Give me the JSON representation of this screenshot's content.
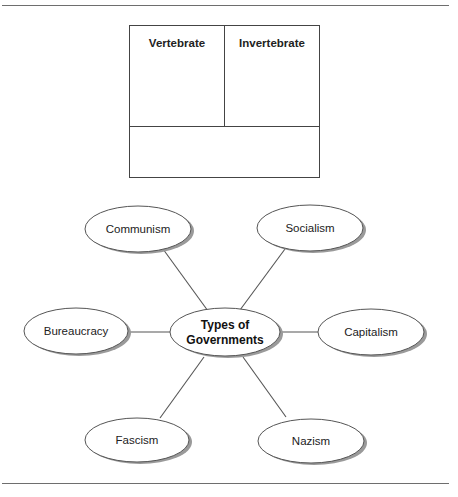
{
  "figure": {
    "caption_fragment": "",
    "top_rule": true,
    "bottom_rule": true
  },
  "chart_box": {
    "columns": [
      {
        "label": "Vertebrate"
      },
      {
        "label": "Invertebrate"
      }
    ],
    "bottom_cell": ""
  },
  "web": {
    "center": {
      "line1": "Types of",
      "line2": "Governments"
    },
    "nodes": [
      {
        "label": "Communism"
      },
      {
        "label": "Socialism"
      },
      {
        "label": "Bureaucracy"
      },
      {
        "label": "Capitalism"
      },
      {
        "label": "Fascism"
      },
      {
        "label": "Nazism"
      }
    ]
  },
  "colors": {
    "stroke": "#555555",
    "shadow": "#9a9a9a",
    "fill": "#ffffff",
    "text": "#222222"
  }
}
